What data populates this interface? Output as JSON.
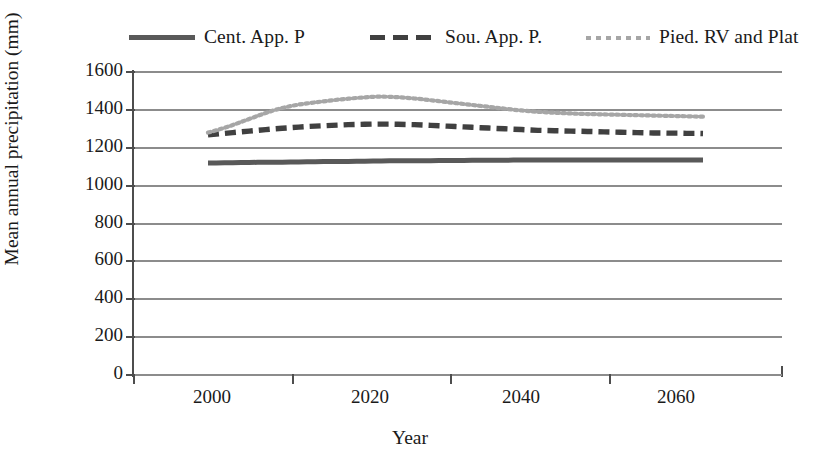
{
  "legend": {
    "items": [
      {
        "label": "Cent. App. P",
        "style": "solid",
        "color": "#595959",
        "key": "legend-key-cent-app-p"
      },
      {
        "label": "Sou. App. P.",
        "style": "dashed",
        "color": "#404040",
        "key": "legend-key-sou-app-p"
      },
      {
        "label": "Pied. RV and Plat",
        "style": "dotted",
        "color": "#a6a6a6",
        "key": "legend-key-pied-rv-and-plat"
      }
    ]
  },
  "axes": {
    "y_title": "Mean annual precipitation (mm)",
    "x_title": "Year",
    "y_ticks": [
      "1600",
      "1400",
      "1200",
      "1000",
      "800",
      "600",
      "400",
      "200",
      "0"
    ],
    "x_ticks": [
      "2000",
      "2020",
      "2040",
      "2060"
    ]
  },
  "chart_data": {
    "type": "line",
    "title": "",
    "xlabel": "Year",
    "ylabel": "Mean annual precipitation (mm)",
    "xlim": [
      2000,
      2068
    ],
    "ylim": [
      0,
      1600
    ],
    "ytick_step": 200,
    "grid": true,
    "legend_position": "top",
    "x": [
      2000,
      2001,
      2002,
      2003,
      2004,
      2005,
      2006,
      2007,
      2008,
      2009,
      2010,
      2011,
      2012,
      2013,
      2014,
      2015,
      2016,
      2017,
      2018,
      2019,
      2020,
      2021,
      2022,
      2023,
      2024,
      2025,
      2026,
      2027,
      2028,
      2029,
      2030,
      2031,
      2032,
      2033,
      2034,
      2035,
      2036,
      2037,
      2038,
      2039,
      2040,
      2041,
      2042,
      2043,
      2044,
      2045,
      2046,
      2047,
      2048,
      2049,
      2050,
      2051,
      2052,
      2053,
      2054,
      2055,
      2056,
      2057,
      2058,
      2059,
      2060
    ],
    "series": [
      {
        "name": "Cent. App. P",
        "style": "solid",
        "color": "#595959",
        "values": [
          1120,
          1120,
          1121,
          1121,
          1122,
          1122,
          1123,
          1123,
          1124,
          1124,
          1125,
          1125,
          1126,
          1126,
          1127,
          1127,
          1128,
          1128,
          1129,
          1129,
          1130,
          1130,
          1131,
          1131,
          1131,
          1132,
          1132,
          1132,
          1133,
          1133,
          1133,
          1133,
          1134,
          1134,
          1134,
          1134,
          1134,
          1135,
          1135,
          1135,
          1135,
          1135,
          1135,
          1135,
          1135,
          1135,
          1135,
          1135,
          1135,
          1135,
          1135,
          1135,
          1135,
          1135,
          1135,
          1135,
          1135,
          1135,
          1135,
          1135,
          1135
        ]
      },
      {
        "name": "Sou. App. P.",
        "style": "dashed",
        "color": "#404040",
        "values": [
          1268,
          1272,
          1276,
          1280,
          1284,
          1288,
          1292,
          1296,
          1300,
          1303,
          1306,
          1309,
          1312,
          1314,
          1316,
          1318,
          1320,
          1322,
          1323,
          1324,
          1325,
          1325,
          1325,
          1324,
          1323,
          1322,
          1320,
          1318,
          1316,
          1314,
          1312,
          1310,
          1308,
          1306,
          1304,
          1302,
          1300,
          1298,
          1296,
          1294,
          1292,
          1291,
          1290,
          1289,
          1288,
          1287,
          1286,
          1285,
          1284,
          1283,
          1282,
          1281,
          1280,
          1279,
          1278,
          1278,
          1277,
          1277,
          1276,
          1276,
          1275
        ]
      },
      {
        "name": "Pied. RV and Plat",
        "style": "dotted",
        "color": "#a6a6a6",
        "values": [
          1280,
          1292,
          1305,
          1320,
          1336,
          1352,
          1368,
          1384,
          1398,
          1410,
          1420,
          1428,
          1434,
          1440,
          1445,
          1450,
          1455,
          1459,
          1463,
          1466,
          1469,
          1470,
          1469,
          1467,
          1464,
          1460,
          1456,
          1451,
          1446,
          1441,
          1436,
          1431,
          1426,
          1421,
          1416,
          1411,
          1406,
          1401,
          1397,
          1393,
          1390,
          1387,
          1385,
          1383,
          1381,
          1379,
          1378,
          1377,
          1376,
          1375,
          1374,
          1373,
          1372,
          1371,
          1370,
          1369,
          1368,
          1367,
          1366,
          1365,
          1364
        ]
      }
    ]
  }
}
